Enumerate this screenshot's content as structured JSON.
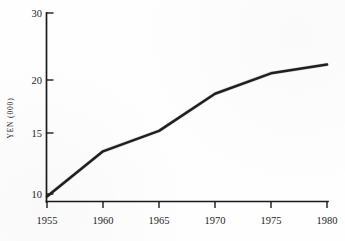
{
  "chart_data": {
    "type": "line",
    "title": "",
    "subtitle": "",
    "xlabel": "",
    "ylabel": "YEN (000)",
    "grid": false,
    "legend": null,
    "legend_position": "none",
    "x": [
      1955,
      1960,
      1965,
      1970,
      1975,
      1980
    ],
    "categories": [
      "1955",
      "1960",
      "1965",
      "1970",
      "1975",
      "1980"
    ],
    "values": [
      9.8,
      13.5,
      15.2,
      18.7,
      21.0,
      22.3
    ],
    "series": [
      {
        "name": "YEN (000)",
        "values": [
          9.8,
          13.5,
          15.2,
          18.7,
          21.0,
          22.3
        ]
      }
    ],
    "xlim": [
      1955,
      1980
    ],
    "ylim": [
      8.2,
      30
    ],
    "x_tick_labels": [
      "1955",
      "1960",
      "1965",
      "1970",
      "1975",
      "1980"
    ],
    "y_tick_labels": [
      "30",
      "20",
      "15",
      "10"
    ],
    "y_tick_values": [
      30,
      20,
      15,
      10
    ],
    "line_color": "#1f1f1f",
    "axis_color": "#1a1a1a",
    "background_color": "#fefefe",
    "annotations": []
  },
  "axes": {
    "y_axis_title": "YEN (000)",
    "y_ticks": [
      {
        "label": "30",
        "value": 30
      },
      {
        "label": "20",
        "value": 20
      },
      {
        "label": "15",
        "value": 15
      },
      {
        "label": "10",
        "value": 10
      }
    ],
    "x_ticks": [
      {
        "label": "1955",
        "value": 1955
      },
      {
        "label": "1960",
        "value": 1960
      },
      {
        "label": "1965",
        "value": 1965
      },
      {
        "label": "1970",
        "value": 1970
      },
      {
        "label": "1975",
        "value": 1975
      },
      {
        "label": "1980",
        "value": 1980
      }
    ]
  }
}
